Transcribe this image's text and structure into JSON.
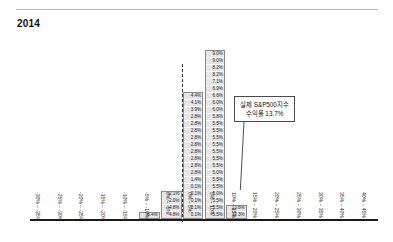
{
  "header": {
    "title": "2014"
  },
  "chart_data": {
    "type": "bar",
    "title": "2014",
    "xlabel": "",
    "ylabel": "",
    "grid": false,
    "legend": null,
    "note": "Stacked histogram of simulated annual S&P500 returns by return bucket; each stacked cell is labelled with a return value.",
    "categories": [
      "-30% ~ -35%",
      "-25% ~ -30%",
      "-20% ~ -25%",
      "-15% ~ -20%",
      "-10% ~ -15%",
      "-5% ~ -10%",
      "0% ~ -5%",
      "0% ~ 5%",
      "5% ~ 10%",
      "10% ~ 15%",
      "15% ~ 20%",
      "20% ~ 25%",
      "25% ~ 30%",
      "30% ~ 35%",
      "35% ~ 40%",
      "40% ~ 45%"
    ],
    "values": [
      0,
      0,
      0,
      0,
      0,
      1,
      4,
      18,
      24,
      2,
      0,
      0,
      0,
      0,
      0,
      0
    ],
    "bars": [
      {
        "category": "-5% ~ -10%",
        "count": 1,
        "cells": [
          "-6.4%"
        ]
      },
      {
        "category": "0% ~ -5%",
        "count": 4,
        "cells": [
          "-2.1%",
          "-2.0%",
          "-4.8%",
          "-4.8%"
        ]
      },
      {
        "category": "0% ~ 5%",
        "count": 18,
        "cells": [
          "4.4%",
          "4.1%",
          "3.9%",
          "2.8%",
          "2.8%",
          "2.8%",
          "2.8%",
          "2.8%",
          "2.8%",
          "2.8%",
          "2.8%",
          "2.8%",
          "1.4%",
          "0.1%",
          "0.1%",
          "0.1%",
          "0.1%",
          "0.1%"
        ]
      },
      {
        "category": "5% ~ 10%",
        "count": 24,
        "cells": [
          "9.0%",
          "9.0%",
          "8.2%",
          "8.2%",
          "7.1%",
          "6.9%",
          "6.6%",
          "6.0%",
          "6.0%",
          "5.8%",
          "5.5%",
          "5.5%",
          "5.5%",
          "5.5%",
          "5.5%",
          "5.5%",
          "5.5%",
          "5.0%",
          "5.5%",
          "5.5%",
          "5.0%",
          "5.5%",
          "5.5%",
          "5.5%"
        ]
      },
      {
        "category": "10% ~ 15%",
        "count": 2,
        "cells": [
          "13.6%",
          "12.3%"
        ]
      }
    ],
    "annotations": [
      {
        "name": "actual-return-callout",
        "line1": "실제 S&P500지수",
        "line2": "수익률 13.7%",
        "points_to": "10% ~ 15%"
      }
    ],
    "axis": {
      "zero_marker": "dashed-line-at-zero"
    }
  }
}
